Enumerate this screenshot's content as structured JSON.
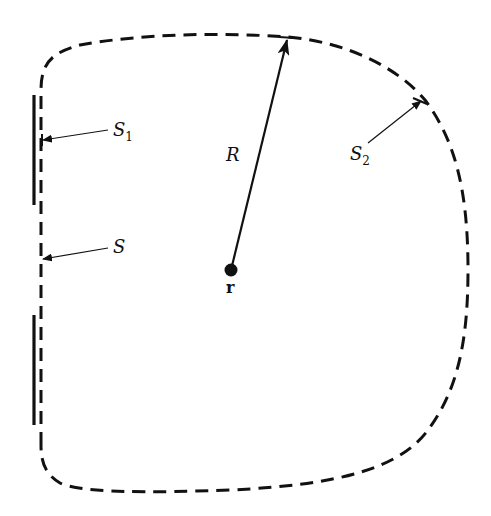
{
  "diagram": {
    "type": "surface-boundary-diagram",
    "labels": {
      "R": "R",
      "r": "r",
      "S": "S",
      "S1_main": "S",
      "S1_sub": "1",
      "S2_main": "S",
      "S2_sub": "2"
    },
    "elements": [
      {
        "name": "closed-surface-S",
        "style": "dashed"
      },
      {
        "name": "screen-segment-upper",
        "style": "solid-thick",
        "label": "S1"
      },
      {
        "name": "screen-segment-lower",
        "style": "solid-thick"
      },
      {
        "name": "radius-arrow",
        "from": "r",
        "to": "S2",
        "label": "R"
      },
      {
        "name": "observation-point",
        "label": "r"
      }
    ],
    "colors": {
      "stroke": "#111111",
      "background": "#ffffff"
    }
  }
}
